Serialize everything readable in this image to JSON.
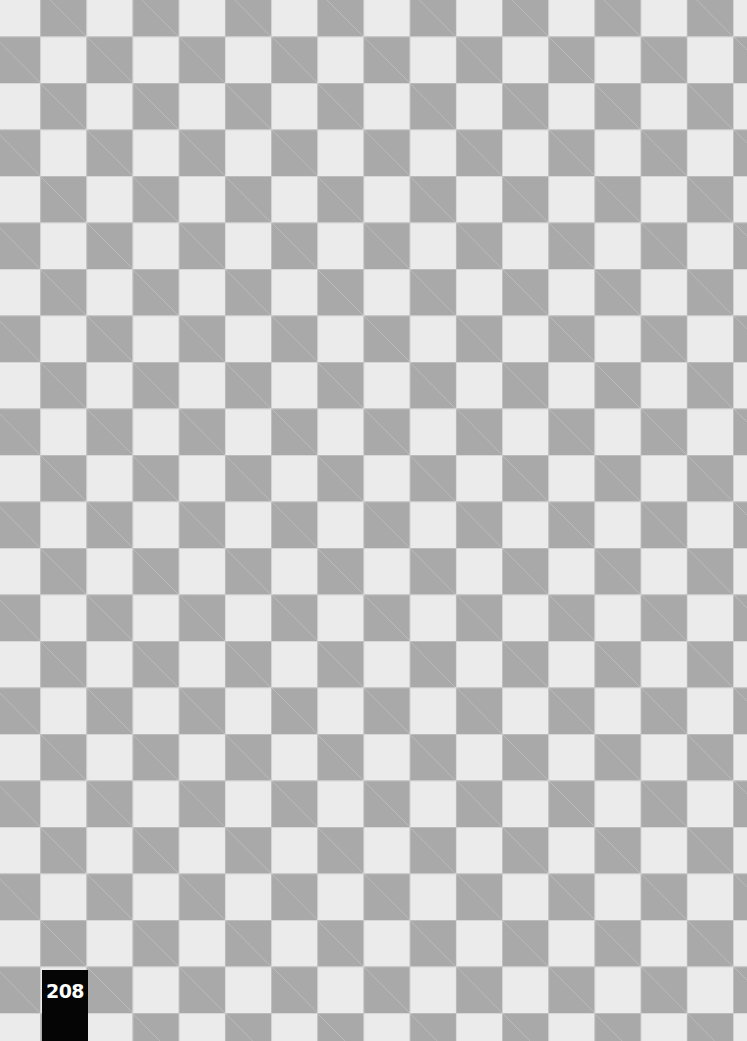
{
  "page": {
    "pattern": "checkerboard",
    "colors": {
      "dark_square": "#a9a9a9",
      "light_square": "#ebebeb",
      "page_number_bg": "#050505",
      "page_number_text": "#ffffff"
    },
    "page_number": "208"
  }
}
